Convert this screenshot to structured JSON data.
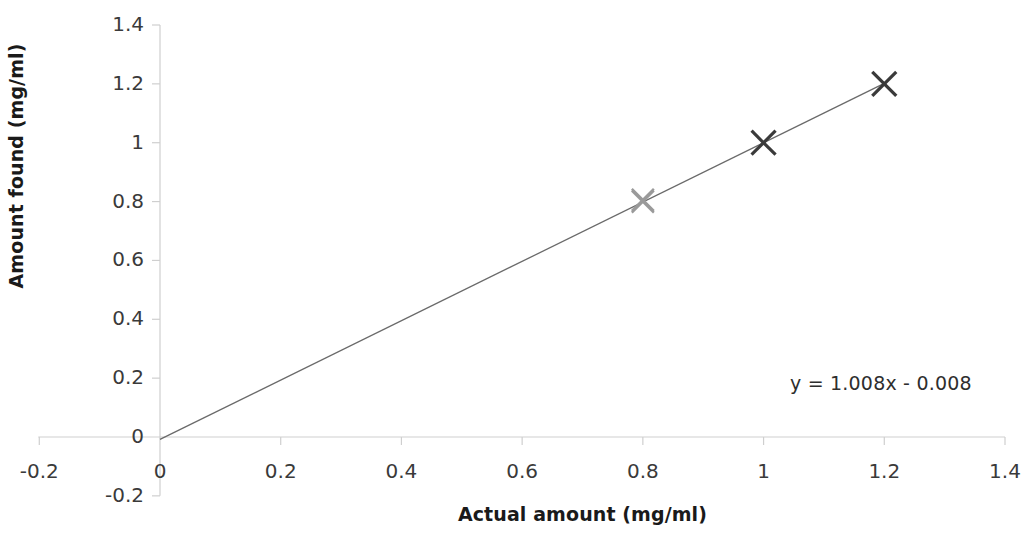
{
  "chart_data": {
    "type": "scatter",
    "title": "",
    "xlabel": "Actual amount (mg/ml)",
    "ylabel": "Amount found (mg/ml)",
    "xlim": [
      -0.2,
      1.4
    ],
    "ylim": [
      -0.2,
      1.4
    ],
    "xticks": [
      "-0.2",
      "0",
      "0.2",
      "0.4",
      "0.6",
      "0.8",
      "1",
      "1.2",
      "1.4"
    ],
    "xtick_values": [
      -0.2,
      0,
      0.2,
      0.4,
      0.6,
      0.8,
      1.0,
      1.2,
      1.4
    ],
    "yticks": [
      "-0.2",
      "0",
      "0.2",
      "0.4",
      "0.6",
      "0.8",
      "1",
      "1.2",
      "1.4"
    ],
    "ytick_values": [
      -0.2,
      0,
      0.2,
      0.4,
      0.6,
      0.8,
      1.0,
      1.2,
      1.4
    ],
    "grid": false,
    "legend": false,
    "marker": "x",
    "series": [
      {
        "name": "Recovery data",
        "x": [
          0.0,
          0.8,
          0.8,
          1.0,
          1.2
        ],
        "y": [
          0.0,
          0.8,
          0.806,
          1.0,
          1.2
        ],
        "marker_colors": [
          "none",
          "#9a9a9a",
          "#9a9a9a",
          "#3a3a3a",
          "#3a3a3a"
        ]
      }
    ],
    "trendline": {
      "equation": "y = 1.008x - 0.008",
      "slope": 1.008,
      "intercept": -0.008,
      "x_start": 0.0,
      "x_end": 1.2,
      "color": "#6a6a6a"
    },
    "annotations": [
      {
        "text": "y = 1.008x - 0.008",
        "x": 1.04,
        "y": 0.295
      }
    ],
    "colors": {
      "axis": "#cfcfcf",
      "line": "#6a6a6a",
      "marker_dark": "#3a3a3a",
      "marker_light": "#9a9a9a",
      "text": "#2b2b2b"
    }
  }
}
